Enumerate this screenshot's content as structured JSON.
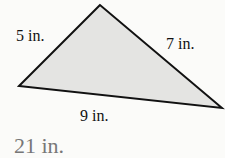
{
  "figure": {
    "shape": "triangle",
    "fill_color": "#e4e4e2",
    "stroke_color": "#111111",
    "vertices": [
      [
        100,
        5
      ],
      [
        19,
        86
      ],
      [
        222,
        108
      ]
    ],
    "sides": {
      "left": "5 in.",
      "right": "7 in.",
      "bottom": "9 in."
    }
  },
  "answer": {
    "text": "21 in.",
    "color": "#777777"
  }
}
